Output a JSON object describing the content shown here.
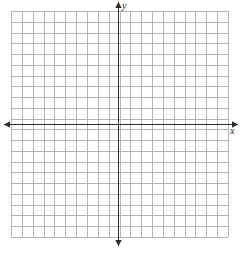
{
  "figure": {
    "kind": "cartesian-coordinate-grid",
    "width": 244,
    "height": 259,
    "background_color": "#ffffff"
  },
  "grid": {
    "line_color": "#b4b4b4",
    "line_width": 1,
    "left": 11,
    "top": 11,
    "right": 228,
    "bottom": 237,
    "columns": 20,
    "rows": 21,
    "cell_width": 10.85,
    "cell_height": 10.76
  },
  "axes": {
    "color": "#2b2b2b",
    "line_width": 1.6,
    "x_axis": {
      "label": "x",
      "y_position": 124,
      "start_x": 4,
      "end_x": 238,
      "arrow_left": true,
      "arrow_right": true
    },
    "y_axis": {
      "label": "y",
      "x_position": 118,
      "start_y": 2,
      "end_y": 246,
      "arrow_up": true,
      "arrow_down": true
    },
    "origin": {
      "x": 118,
      "y": 124
    },
    "tick_labels": [],
    "show_tick_labels": false
  },
  "chart_data": {
    "type": "scatter",
    "title": "",
    "xlabel": "x",
    "ylabel": "y",
    "series": [
      {
        "name": "",
        "x": [],
        "y": []
      }
    ],
    "xlim": [
      -10,
      10
    ],
    "ylim": [
      -11,
      10
    ],
    "xticks": [],
    "yticks": [],
    "grid": true,
    "legend": false,
    "annotations": []
  }
}
